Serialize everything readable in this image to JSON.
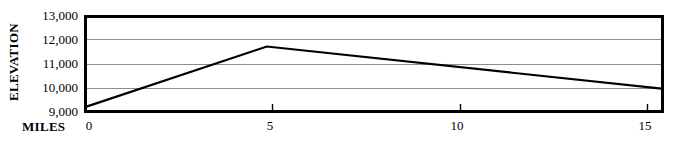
{
  "chart_data": {
    "type": "line",
    "title": "",
    "xlabel": "MILES",
    "ylabel": "ELEVATION",
    "xlim": [
      0,
      15.45
    ],
    "ylim": [
      9000,
      13000
    ],
    "grid": true,
    "legend": "none",
    "x_tick_labels": [
      "0",
      "5",
      "10",
      "15"
    ],
    "x_ticks": [
      0,
      5,
      10,
      15
    ],
    "y_tick_labels": [
      "9,000",
      "10,000",
      "11,000",
      "12,000",
      "13,000"
    ],
    "y_ticks": [
      9000,
      10000,
      11000,
      12000,
      13000
    ],
    "series": [
      {
        "name": "Elevation profile",
        "color": "#000000",
        "x": [
          0,
          4.85,
          15.45
        ],
        "values": [
          9200,
          11700,
          9950
        ]
      }
    ],
    "points": [
      {
        "x": 0,
        "y": 9200
      },
      {
        "x": 4.85,
        "y": 11700
      },
      {
        "x": 15.45,
        "y": 9950
      }
    ]
  },
  "style": {
    "border_color": "#000000",
    "gridline_color": "#8c8c8c",
    "line_color": "#1a1a1a",
    "background": "#ffffff"
  }
}
